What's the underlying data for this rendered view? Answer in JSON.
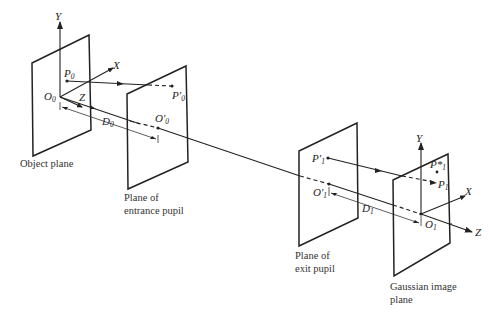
{
  "diagram": {
    "planes": [
      {
        "id": "object-plane",
        "caption_lines": [
          "Object plane"
        ]
      },
      {
        "id": "entrance-pupil-plane",
        "caption_lines": [
          "Plane of",
          "entrance pupil"
        ]
      },
      {
        "id": "exit-pupil-plane",
        "caption_lines": [
          "Plane of",
          "exit pupil"
        ]
      },
      {
        "id": "gaussian-image-plane",
        "caption_lines": [
          "Gaussian image",
          "plane"
        ]
      }
    ],
    "labels": {
      "Y0": "Y",
      "X0": "X",
      "Z0": "Z",
      "P0_base": "P",
      "P0_sub": "0",
      "O0_base": "O",
      "O0_sub": "0",
      "P0p_base": "P′",
      "P0p_sub": "0",
      "O0p_base": "O′",
      "O0p_sub": "0",
      "D0_base": "D",
      "D0_sub": "0",
      "P1p_base": "P′",
      "P1p_sub": "1",
      "O1p_base": "O′",
      "O1p_sub": "1",
      "D1_base": "D",
      "D1_sub": "1",
      "Y1": "Y",
      "X1": "X",
      "Z1": "Z",
      "P1star_base": "P*",
      "P1star_sub": "1",
      "P1_base": "P",
      "P1_sub": "1",
      "O1_base": "O",
      "O1_sub": "1"
    }
  }
}
